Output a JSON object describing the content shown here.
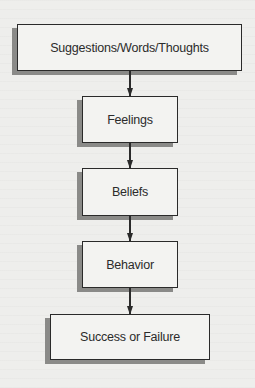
{
  "diagram": {
    "type": "vertical-flowchart",
    "nodes": [
      {
        "id": "suggestions",
        "label": "Suggestions/Words/Thoughts"
      },
      {
        "id": "feelings",
        "label": "Feelings"
      },
      {
        "id": "beliefs",
        "label": "Beliefs"
      },
      {
        "id": "behavior",
        "label": "Behavior"
      },
      {
        "id": "outcome",
        "label": "Success or Failure"
      }
    ],
    "edges": [
      {
        "from": "suggestions",
        "to": "feelings"
      },
      {
        "from": "feelings",
        "to": "beliefs"
      },
      {
        "from": "beliefs",
        "to": "behavior"
      },
      {
        "from": "behavior",
        "to": "outcome"
      }
    ],
    "colors": {
      "background": "#eeeeec",
      "box_fill": "#f3f3f1",
      "stroke": "#2a2a2a",
      "shadow": "#8a8a88",
      "text": "#2b2b2b"
    }
  }
}
